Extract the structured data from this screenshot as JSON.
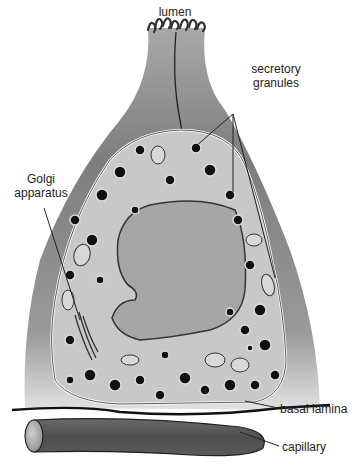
{
  "figure": {
    "labels": {
      "lumen": "lumen",
      "secretory_granules_line1": "secretory",
      "secretory_granules_line2": "granules",
      "golgi_line1": "Golgi",
      "golgi_line2": "apparatus",
      "basal_lamina": "basal lamina",
      "capillary": "capillary"
    },
    "colors": {
      "cell_outer": "#8a8a8a",
      "cytoplasm": "#c9c9c9",
      "nucleus": "#a8a8a8",
      "granule": "#111111",
      "capillary": "#555555",
      "text": "#222222"
    }
  }
}
